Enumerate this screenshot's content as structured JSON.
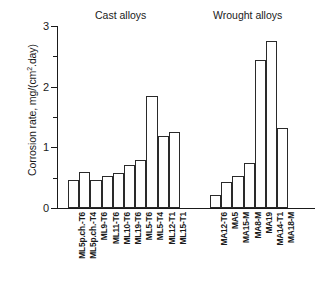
{
  "chart_data": {
    "type": "bar",
    "title": "",
    "xlabel": "",
    "ylabel": "Corrosion rate, mg/(cm2.day)",
    "ylabel_parts": {
      "pre": "Corrosion rate, mg/(cm",
      "sup": "2",
      "post": ".day)"
    },
    "ylim": [
      0,
      3
    ],
    "ytick_labels": [
      "0",
      "1",
      "2",
      "3"
    ],
    "ytick_values": [
      0,
      1,
      2,
      3
    ],
    "yminor_values": [
      0.5,
      1.5,
      2.5
    ],
    "grid": false,
    "legend": "none",
    "groups": [
      {
        "name": "cast",
        "label": "Cast alloys",
        "categories": [
          "ML5p.ch.-T6",
          "ML5p.ch.-T4",
          "ML9-T6",
          "ML11-T6",
          "ML10-T6",
          "ML19-T6",
          "ML5-T6",
          "ML5-T4",
          "ML12-T1",
          "ML15-T1"
        ],
        "values": [
          0.46,
          0.59,
          0.46,
          0.52,
          0.58,
          0.71,
          0.79,
          1.84,
          1.18,
          1.26
        ]
      },
      {
        "name": "wrought",
        "label": "Wrought alloys",
        "categories": [
          "MA12-T6",
          "MA5",
          "MA15-M",
          "MA8-M",
          "MA19",
          "MA14-T1",
          "MA18-M"
        ],
        "values": [
          0.22,
          0.43,
          0.52,
          0.74,
          2.44,
          2.76,
          1.32
        ]
      }
    ],
    "colors": {
      "bar_fill": "#ffffff",
      "bar_stroke": "#2a2a2a",
      "axis": "#1a1a1a",
      "background": "#ffffff"
    }
  }
}
